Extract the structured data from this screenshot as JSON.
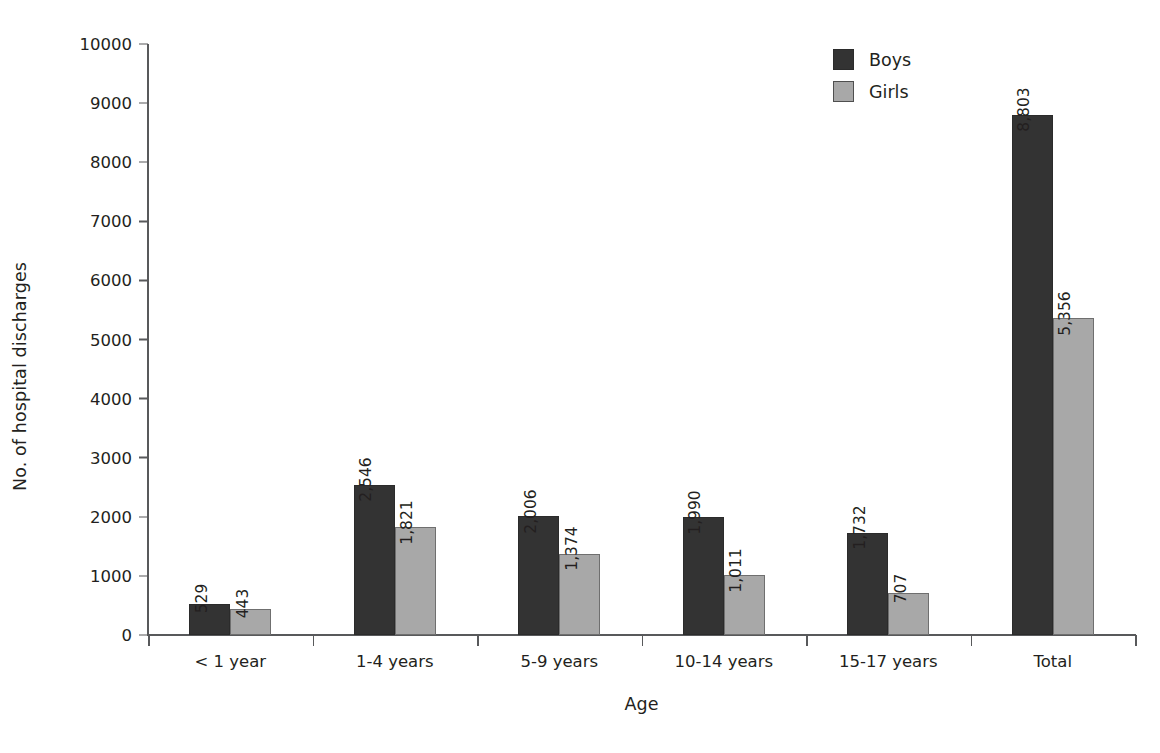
{
  "chart_data": {
    "type": "bar",
    "title": "",
    "xlabel": "Age",
    "ylabel": "No. of hospital discharges",
    "categories": [
      "< 1 year",
      "1-4 years",
      "5-9 years",
      "10-14 years",
      "15-17 years",
      "Total"
    ],
    "series": [
      {
        "name": "Boys",
        "color": "#333333",
        "values": [
          529,
          2546,
          2006,
          1990,
          1732,
          8803
        ],
        "labels": [
          "529",
          "2,546",
          "2,006",
          "1,990",
          "1,732",
          "8,803"
        ]
      },
      {
        "name": "Girls",
        "color": "#a8a8a8",
        "values": [
          443,
          1821,
          1374,
          1011,
          707,
          5356
        ],
        "labels": [
          "443",
          "1,821",
          "1,374",
          "1,011",
          "707",
          "5,356"
        ]
      }
    ],
    "ylim": [
      0,
      10000
    ],
    "yticks": [
      0,
      1000,
      2000,
      3000,
      4000,
      5000,
      6000,
      7000,
      8000,
      9000,
      10000
    ],
    "ytick_labels": [
      "0",
      "1000",
      "2000",
      "3000",
      "4000",
      "5000",
      "6000",
      "7000",
      "8000",
      "9000",
      "10000"
    ],
    "grid": false,
    "legend_position": "top-right",
    "legend_entries": [
      "Boys",
      "Girls"
    ]
  }
}
